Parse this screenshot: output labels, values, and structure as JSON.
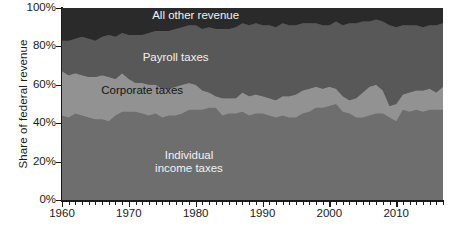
{
  "chart_data": {
    "type": "area",
    "stacked": true,
    "percent_stacked": true,
    "title": "",
    "subtitle": "",
    "xlabel": "",
    "ylabel": "Share of  federal revenue",
    "xlim": [
      1960,
      2017
    ],
    "ylim": [
      0,
      100
    ],
    "grid": false,
    "legend_position": "inline-labels",
    "y_tick_labels": [
      "0%",
      "20%",
      "40%",
      "60%",
      "80%",
      "100%"
    ],
    "y_tick_values": [
      0,
      20,
      40,
      60,
      80,
      100
    ],
    "x_tick_labels": [
      "1960",
      "1970",
      "1980",
      "1990",
      "2000",
      "2010"
    ],
    "x_tick_values": [
      1960,
      1970,
      1980,
      1990,
      2000,
      2010
    ],
    "x_minor_tick_interval": 1,
    "annotations": [
      {
        "text": "All other revenue",
        "x": 1980,
        "y": 96,
        "color": "#f2f2f2"
      },
      {
        "text": "Payroll taxes",
        "x": 1977,
        "y": 74,
        "color": "#f2f2f2"
      },
      {
        "text": "Corporate taxes",
        "x": 1972,
        "y": 57,
        "color": "#141414"
      },
      {
        "text": "Individual\nincome taxes",
        "x": 1979,
        "y": 23,
        "color": "#f2f2f2"
      }
    ],
    "colors": {
      "individual_income_taxes": "#6e6e6e",
      "corporate_taxes": "#929292",
      "payroll_taxes": "#585858",
      "all_other_revenue": "#2a2a2a",
      "axis": "#1a1a1a",
      "background": "#ffffff"
    },
    "x": [
      1960,
      1961,
      1962,
      1963,
      1964,
      1965,
      1966,
      1967,
      1968,
      1969,
      1970,
      1971,
      1972,
      1973,
      1974,
      1975,
      1976,
      1977,
      1978,
      1979,
      1980,
      1981,
      1982,
      1983,
      1984,
      1985,
      1986,
      1987,
      1988,
      1989,
      1990,
      1991,
      1992,
      1993,
      1994,
      1995,
      1996,
      1997,
      1998,
      1999,
      2000,
      2001,
      2002,
      2003,
      2004,
      2005,
      2006,
      2007,
      2008,
      2009,
      2010,
      2011,
      2012,
      2013,
      2014,
      2015,
      2016,
      2017
    ],
    "series": [
      {
        "name": "Individual income taxes",
        "color": "#6e6e6e",
        "values": [
          44,
          43,
          45,
          44,
          43,
          42,
          42,
          41,
          44,
          46,
          46,
          46,
          45,
          44,
          45,
          43,
          44,
          44,
          45,
          47,
          47,
          47,
          48,
          48,
          44,
          45,
          45,
          46,
          44,
          45,
          45,
          44,
          43,
          44,
          43,
          43,
          45,
          46,
          48,
          48,
          49,
          50,
          46,
          45,
          43,
          43,
          44,
          45,
          45,
          43,
          41,
          47,
          46,
          47,
          46,
          47,
          47,
          47
        ]
      },
      {
        "name": "Corporate taxes",
        "color": "#929292",
        "values": [
          23,
          22,
          21,
          21,
          21,
          22,
          23,
          23,
          19,
          20,
          17,
          15,
          16,
          16,
          15,
          15,
          14,
          15,
          15,
          14,
          13,
          10,
          8,
          6,
          9,
          8,
          8,
          10,
          10,
          10,
          9,
          9,
          9,
          10,
          11,
          12,
          12,
          12,
          11,
          10,
          10,
          8,
          8,
          7,
          10,
          13,
          15,
          15,
          12,
          6,
          9,
          8,
          10,
          10,
          11,
          11,
          9,
          12
        ]
      },
      {
        "name": "Payroll taxes",
        "color": "#585858",
        "values": [
          16,
          18,
          18,
          20,
          20,
          19,
          20,
          22,
          22,
          21,
          23,
          25,
          25,
          27,
          28,
          30,
          30,
          30,
          30,
          30,
          31,
          32,
          34,
          35,
          36,
          36,
          37,
          36,
          37,
          37,
          37,
          38,
          38,
          38,
          37,
          36,
          35,
          34,
          33,
          33,
          32,
          35,
          37,
          40,
          39,
          37,
          34,
          34,
          36,
          42,
          40,
          36,
          35,
          34,
          33,
          33,
          35,
          33
        ]
      },
      {
        "name": "All other revenue",
        "color": "#2a2a2a",
        "values": [
          17,
          17,
          16,
          15,
          16,
          17,
          15,
          14,
          15,
          13,
          14,
          14,
          14,
          13,
          12,
          12,
          12,
          11,
          10,
          9,
          9,
          11,
          10,
          11,
          11,
          11,
          10,
          8,
          9,
          8,
          9,
          9,
          10,
          8,
          9,
          9,
          8,
          8,
          8,
          9,
          9,
          7,
          9,
          8,
          8,
          7,
          7,
          6,
          7,
          9,
          10,
          9,
          9,
          9,
          10,
          9,
          9,
          8
        ]
      }
    ]
  }
}
